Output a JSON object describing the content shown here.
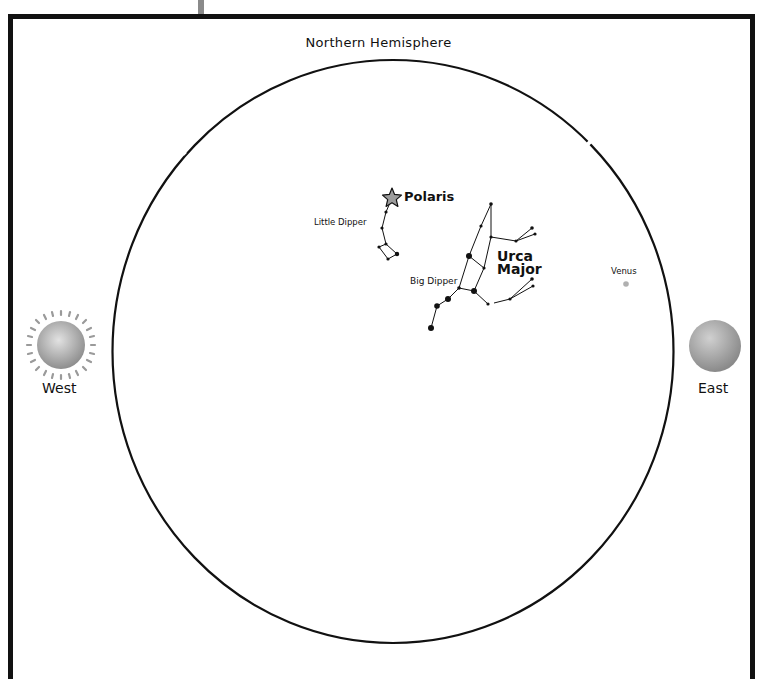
{
  "diagram": {
    "title": "Northern Hemisphere",
    "directions": {
      "west": "West",
      "east": "East"
    },
    "labels": {
      "polaris": "Polaris",
      "little_dipper": "Little Dipper",
      "big_dipper": "Big Dipper",
      "ursa_major_line1": "Urca",
      "ursa_major_line2": "Major",
      "venus": "Venus"
    },
    "objects": {
      "sun": {
        "position": "west",
        "color": "#a8a8a8"
      },
      "moon": {
        "position": "east",
        "color": "#9a9a9a"
      },
      "venus": {
        "color": "#b0b0b0"
      },
      "polaris": {
        "color": "#9c9c9c"
      }
    },
    "colors": {
      "line": "#111111",
      "frame": "#111111",
      "post": "#8a8a8a"
    }
  }
}
